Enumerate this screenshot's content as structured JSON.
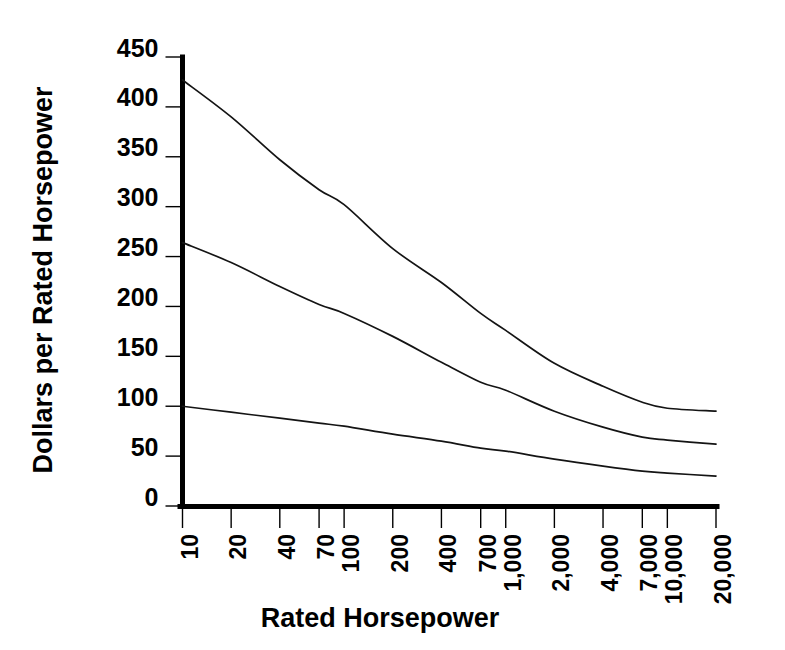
{
  "chart_data": {
    "type": "line",
    "title": "",
    "xlabel": "Rated Horsepower",
    "ylabel": "Dollars per Rated Horsepower",
    "xscale": "log",
    "xlim": [
      10,
      20000
    ],
    "ylim": [
      0,
      450
    ],
    "grid": false,
    "legend": null,
    "xtick_labels": [
      "10",
      "20",
      "40",
      "70",
      "100",
      "200",
      "400",
      "700",
      "1,000",
      "2,000",
      "4,000",
      "7,000",
      "10,000",
      "20,000"
    ],
    "xtick_values": [
      10,
      20,
      40,
      70,
      100,
      200,
      400,
      700,
      1000,
      2000,
      4000,
      7000,
      10000,
      20000
    ],
    "xtick_rotation": -90,
    "ytick_labels": [
      "0",
      "50",
      "100",
      "150",
      "200",
      "250",
      "300",
      "350",
      "400",
      "450"
    ],
    "ytick_values": [
      0,
      50,
      100,
      150,
      200,
      250,
      300,
      350,
      400,
      450
    ],
    "x": [
      10,
      20,
      40,
      70,
      100,
      200,
      400,
      700,
      1000,
      2000,
      4000,
      7000,
      10000,
      20000
    ],
    "series": [
      {
        "name": "upper-curve",
        "values": [
          427,
          390,
          347,
          317,
          302,
          258,
          224,
          193,
          176,
          143,
          120,
          104,
          98,
          95
        ]
      },
      {
        "name": "middle-curve",
        "values": [
          264,
          244,
          220,
          202,
          193,
          170,
          144,
          124,
          116,
          95,
          79,
          69,
          66,
          62
        ]
      },
      {
        "name": "lower-curve",
        "values": [
          100,
          94,
          88,
          83,
          80,
          72,
          65,
          58,
          55,
          47,
          40,
          35,
          33,
          30
        ]
      }
    ]
  },
  "axis_titles": {
    "x": "Rated Horsepower",
    "y": "Dollars per Rated Horsepower"
  }
}
